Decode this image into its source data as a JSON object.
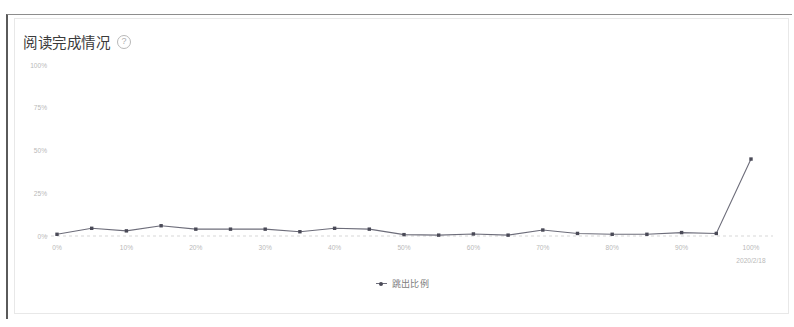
{
  "card": {
    "title": "阅读完成情况",
    "help_icon": "question-circle-icon"
  },
  "legend": {
    "items": [
      {
        "label": "跳出比例",
        "color": "#4a4a57",
        "marker": "line-dot-marker"
      }
    ]
  },
  "footer": {
    "date_label": "2020/2/18"
  },
  "chart_data": {
    "type": "line",
    "title": "阅读完成情况",
    "xlabel": "",
    "ylabel": "",
    "ylim": [
      0,
      100
    ],
    "yticks": [
      0,
      25,
      50,
      75,
      100
    ],
    "ytick_labels": [
      "0%",
      "25%",
      "50%",
      "75%",
      "100%"
    ],
    "grid": false,
    "legend_position": "bottom-center",
    "categories": [
      "0%",
      "5%",
      "10%",
      "15%",
      "20%",
      "25%",
      "30%",
      "35%",
      "40%",
      "45%",
      "50%",
      "55%",
      "60%",
      "65%",
      "70%",
      "75%",
      "80%",
      "85%",
      "90%",
      "95%",
      "100%"
    ],
    "xtick_labels": [
      "0%",
      "10%",
      "20%",
      "30%",
      "40%",
      "50%",
      "60%",
      "70%",
      "80%",
      "90%",
      "100%"
    ],
    "xtick_indices": [
      0,
      2,
      4,
      6,
      8,
      10,
      12,
      14,
      16,
      18,
      20
    ],
    "series": [
      {
        "name": "跳出比例",
        "color": "#4a4a57",
        "values": [
          1.0,
          4.5,
          3.0,
          6.0,
          4.0,
          4.0,
          4.0,
          2.5,
          4.5,
          4.0,
          0.8,
          0.5,
          1.2,
          0.5,
          3.5,
          1.5,
          1.0,
          1.0,
          2.0,
          1.5,
          45.0
        ]
      }
    ]
  }
}
